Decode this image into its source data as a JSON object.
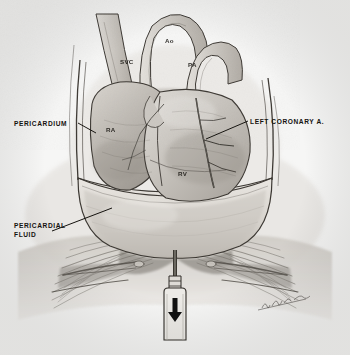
{
  "figure": {
    "background_color": "#f6f6f5",
    "ink_color": "#15130f",
    "medium": "graphite pencil medical illustration"
  },
  "callout_labels": [
    {
      "id": "pericardium",
      "text": "PERICARDIUM",
      "x": 14,
      "y": 119
    },
    {
      "id": "pericardial-fluid",
      "text": "PERICARDIAL\nFLUID",
      "x": 14,
      "y": 221
    },
    {
      "id": "left-coronary",
      "text": "LEFT CORONARY A.",
      "x": 250,
      "y": 117
    }
  ],
  "structure_labels": [
    {
      "id": "svc",
      "text": "SVC",
      "x": 120,
      "y": 57
    },
    {
      "id": "ao",
      "text": "Ao",
      "x": 165,
      "y": 36
    },
    {
      "id": "pa",
      "text": "PA",
      "x": 188,
      "y": 60
    },
    {
      "id": "ra",
      "text": "RA",
      "x": 106,
      "y": 125
    },
    {
      "id": "rv",
      "text": "RV",
      "x": 178,
      "y": 169
    }
  ],
  "instrument": {
    "name": "aspiration syringe and needle",
    "arrow_direction": "down",
    "arrow_color": "#111111"
  },
  "signature": {
    "present": true,
    "style": "cursive",
    "x": 262,
    "y": 300
  }
}
